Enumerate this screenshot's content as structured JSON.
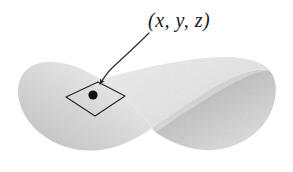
{
  "figure": {
    "kind": "parametric-surface-diagram",
    "background_color": "#ffffff",
    "width": 293,
    "height": 172
  },
  "annotation": {
    "point_label": "(x, y, z)",
    "leader_line": "curved-arrow",
    "arrow_color": "#2b2b2b",
    "label_color": "#1a1a1a"
  },
  "surface": {
    "name": "twisted-ribbon-surface",
    "fill_light": "#f2f2f2",
    "fill_mid": "#d8d8d8",
    "fill_dark": "#b9b9b9",
    "edge_color": "#c9c9c9"
  },
  "patch": {
    "name": "surface-patch-parallelogram",
    "stroke_color": "#242424",
    "stroke_width": 1.1,
    "fill": "none",
    "vertices": [
      [
        66,
        97
      ],
      [
        98,
        82
      ],
      [
        125,
        96
      ],
      [
        95,
        116
      ]
    ]
  },
  "marked_point": {
    "name": "point-dot",
    "x": 93,
    "y": 95,
    "radius": 4.6,
    "color": "#111111"
  }
}
